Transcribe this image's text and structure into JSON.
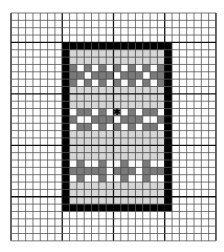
{
  "grid": {
    "origin_x": 11,
    "origin_y": 13,
    "cols": 28,
    "rows": 31,
    "cell_w": 7.32,
    "cell_h": 7.35,
    "major_every": 7,
    "major_offset_col": 7,
    "major_offset_row": 4,
    "line_color": "#555555",
    "major_line_color": "#111111",
    "background": "#ffffff"
  },
  "frame": {
    "col_start": 7,
    "row_start": 4,
    "col_end": 21,
    "row_end": 26,
    "color": "#000000"
  },
  "colors": {
    "L": "#d6d6d6",
    "D": "#7a7a7a",
    "W": "#ffffff",
    "X": "#7a7a7a"
  },
  "marker": {
    "row": 8,
    "col": 6,
    "glyph": "✱",
    "color": "#000000"
  },
  "pattern": [
    "LLLLLLLLLLLLL",
    "LLLLLLLLLLLLL",
    "DWDWDWDWDWDWD",
    "DDWDDDWDDDWDD",
    "DWDWDWDWDWDWD",
    "LLLLLLLLLLLLL",
    "LLLLLLLLLLLLL",
    "LLLLLLLLLLLLL",
    "WDDWDWXWDWDDW",
    "DWWDDDWDDDWWD",
    "WDDWDWDWDWDDW",
    "LLLLLLLLLLLLL",
    "LLLLLLLLLLLLL",
    "LLLLLLLLLLLLL",
    "LLLLLLLLLLLLL",
    "WDWWDWWDWWDWW",
    "DDDDDWDDDWDDD",
    "WDWWDWWDWWDWW",
    "LLLLLLLLLLLLL",
    "LLLLLLLLLLLLL",
    "LLLLLLLLLLLLL"
  ]
}
